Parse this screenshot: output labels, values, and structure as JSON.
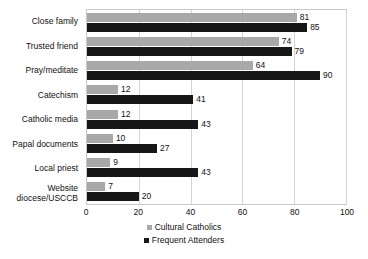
{
  "chart_data": {
    "type": "bar",
    "orientation": "horizontal",
    "title": "",
    "xlabel": "",
    "ylabel": "",
    "xlim": [
      0,
      100
    ],
    "xticks": [
      0,
      20,
      40,
      60,
      80,
      100
    ],
    "grid": true,
    "legend_position": "bottom",
    "categories": [
      "Close family",
      "Trusted friend",
      "Pray/meditate",
      "Catechism",
      "Catholic media",
      "Papal documents",
      "Local priest",
      "Website diocese/USCCB"
    ],
    "series": [
      {
        "name": "Cultural Catholics",
        "color": "#a8a8a8",
        "values": [
          81,
          74,
          64,
          12,
          12,
          10,
          9,
          7
        ]
      },
      {
        "name": "Frequent Attenders",
        "color": "#171717",
        "values": [
          85,
          79,
          90,
          41,
          43,
          27,
          43,
          20
        ]
      }
    ]
  }
}
